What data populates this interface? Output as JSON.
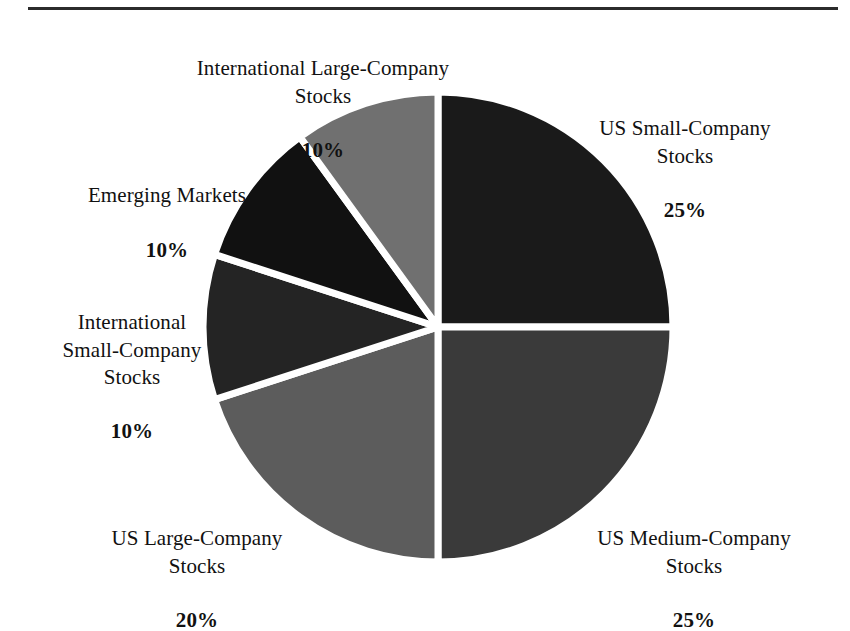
{
  "figure": {
    "has_top_rule": true,
    "background_color": "#ffffff",
    "text_color": "#111111",
    "separator_color": "#ffffff"
  },
  "chart_data": {
    "type": "pie",
    "title": "",
    "subtitle": "",
    "xlabel": "",
    "ylabel": "",
    "legend_position": "none",
    "grid": false,
    "value_unit": "%",
    "total": 100,
    "start_angle_deg": 0,
    "direction": "clockwise",
    "categories": [
      "US Small-Company Stocks",
      "US Medium-Company Stocks",
      "US Large-Company Stocks",
      "International Small-Company Stocks",
      "Emerging Markets",
      "International Large-Company Stocks"
    ],
    "values": [
      25,
      25,
      20,
      10,
      10,
      10
    ],
    "slices": [
      {
        "name": "US Small-Company Stocks",
        "value": 25,
        "value_label": "25%",
        "color": "#1a1a1a",
        "start_deg": 0,
        "end_deg": 90,
        "label_lines": [
          "US Small-Company",
          "Stocks",
          "25%"
        ]
      },
      {
        "name": "US Medium-Company Stocks",
        "value": 25,
        "value_label": "25%",
        "color": "#3a3a3a",
        "start_deg": 90,
        "end_deg": 180,
        "label_lines": [
          "US Medium-Company",
          "Stocks",
          "25%"
        ]
      },
      {
        "name": "US Large-Company Stocks",
        "value": 20,
        "value_label": "20%",
        "color": "#5c5c5c",
        "start_deg": 180,
        "end_deg": 252,
        "label_lines": [
          "US Large-Company",
          "Stocks",
          "20%"
        ]
      },
      {
        "name": "International Small-Company Stocks",
        "value": 10,
        "value_label": "10%",
        "color": "#242424",
        "start_deg": 252,
        "end_deg": 288,
        "label_lines": [
          "International",
          "Small-Company",
          "Stocks",
          "10%"
        ]
      },
      {
        "name": "Emerging Markets",
        "value": 10,
        "value_label": "10%",
        "color": "#111111",
        "start_deg": 288,
        "end_deg": 324,
        "label_lines": [
          "Emerging Markets",
          "10%"
        ]
      },
      {
        "name": "International Large-Company Stocks",
        "value": 10,
        "value_label": "10%",
        "color": "#707070",
        "start_deg": 324,
        "end_deg": 360,
        "label_lines": [
          "International Large-Company",
          "Stocks",
          "10%"
        ]
      }
    ]
  },
  "labels": {
    "us_small": {
      "name": "US Small-Company\nStocks",
      "pct": "25%"
    },
    "us_medium": {
      "name": "US Medium-Company\nStocks",
      "pct": "25%"
    },
    "us_large": {
      "name": "US Large-Company\nStocks",
      "pct": "20%"
    },
    "intl_small": {
      "name": "International\nSmall-Company\nStocks",
      "pct": "10%"
    },
    "emerging": {
      "name": "Emerging Markets",
      "pct": "10%"
    },
    "intl_large": {
      "name": "International Large-Company\nStocks",
      "pct": "10%"
    }
  }
}
